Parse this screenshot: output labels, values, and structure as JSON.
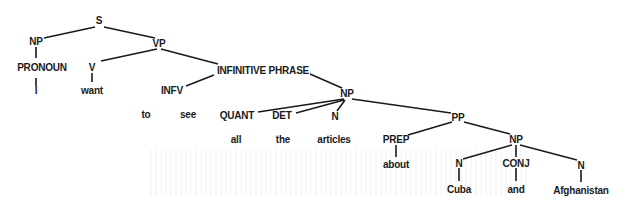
{
  "diagram": {
    "type": "parse-tree",
    "sentence": "I want to see all the articles about Cuba and Afghanistan",
    "nodes": [
      {
        "id": "S",
        "label": "S",
        "x": 99,
        "y": 20
      },
      {
        "id": "NP1",
        "label": "NP",
        "x": 36,
        "y": 41
      },
      {
        "id": "VP",
        "label": "VP",
        "x": 159,
        "y": 43
      },
      {
        "id": "PRONOUN",
        "label": "PRONOUN",
        "x": 42,
        "y": 67
      },
      {
        "id": "V",
        "label": "V",
        "x": 92,
        "y": 67
      },
      {
        "id": "INFP",
        "label": "INFINITIVE PHRASE",
        "x": 263,
        "y": 70
      },
      {
        "id": "I",
        "label": "I",
        "x": 36,
        "y": 90
      },
      {
        "id": "want",
        "label": "want",
        "x": 92,
        "y": 90
      },
      {
        "id": "INFV",
        "label": "INFV",
        "x": 172,
        "y": 90
      },
      {
        "id": "NP2",
        "label": "NP",
        "x": 347,
        "y": 93
      },
      {
        "id": "to",
        "label": "to",
        "x": 146,
        "y": 114
      },
      {
        "id": "see",
        "label": "see",
        "x": 188,
        "y": 114
      },
      {
        "id": "QUANT",
        "label": "QUANT",
        "x": 237,
        "y": 115
      },
      {
        "id": "DET",
        "label": "DET",
        "x": 282,
        "y": 115
      },
      {
        "id": "N1",
        "label": "N",
        "x": 335,
        "y": 116
      },
      {
        "id": "PP",
        "label": "PP",
        "x": 458,
        "y": 117
      },
      {
        "id": "all",
        "label": "all",
        "x": 236,
        "y": 139
      },
      {
        "id": "the",
        "label": "the",
        "x": 283,
        "y": 139
      },
      {
        "id": "articles",
        "label": "articles",
        "x": 334,
        "y": 139
      },
      {
        "id": "PREP",
        "label": "PREP",
        "x": 396,
        "y": 139
      },
      {
        "id": "NP3",
        "label": "NP",
        "x": 516,
        "y": 139
      },
      {
        "id": "N2",
        "label": "N",
        "x": 459,
        "y": 163
      },
      {
        "id": "CONJ",
        "label": "CONJ",
        "x": 516,
        "y": 163
      },
      {
        "id": "N3",
        "label": "N",
        "x": 581,
        "y": 165
      },
      {
        "id": "about",
        "label": "about",
        "x": 396,
        "y": 164
      },
      {
        "id": "Cuba",
        "label": "Cuba",
        "x": 459,
        "y": 189
      },
      {
        "id": "and",
        "label": "and",
        "x": 516,
        "y": 189
      },
      {
        "id": "Afghanistan",
        "label": "Afghanistan",
        "x": 581,
        "y": 190
      }
    ],
    "edges": [
      [
        44,
        38,
        95,
        27
      ],
      [
        104,
        27,
        155,
        38
      ],
      [
        36,
        47,
        36,
        58
      ],
      [
        101,
        61,
        157,
        49
      ],
      [
        161,
        49,
        218,
        64
      ],
      [
        92,
        73,
        92,
        82
      ],
      [
        36,
        78,
        36,
        86
      ],
      [
        186,
        86,
        214,
        75
      ],
      [
        310,
        74,
        342,
        88
      ],
      [
        258,
        112,
        344,
        99
      ],
      [
        296,
        113,
        344,
        100
      ],
      [
        337,
        111,
        345,
        100
      ],
      [
        352,
        99,
        451,
        113
      ],
      [
        408,
        135,
        452,
        122
      ],
      [
        464,
        122,
        510,
        134
      ],
      [
        396,
        145,
        396,
        157
      ],
      [
        463,
        159,
        512,
        145
      ],
      [
        516,
        145,
        516,
        157
      ],
      [
        520,
        145,
        577,
        160
      ],
      [
        459,
        168,
        459,
        181
      ],
      [
        516,
        168,
        516,
        181
      ],
      [
        581,
        170,
        581,
        182
      ]
    ],
    "colors": {
      "ink": "#1a1a1a",
      "background": "#ffffff"
    }
  }
}
